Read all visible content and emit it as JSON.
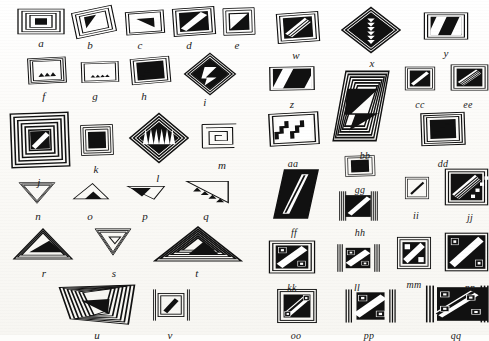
{
  "plate": {
    "kind": "figure-plate",
    "description": "Black-and-white geometric design motif typology plate",
    "background_color": "#fbfaf7",
    "ink_color": "#111111",
    "width": 489,
    "height": 335,
    "columns": 2
  },
  "figures": [
    {
      "label": "a",
      "shape": "rect",
      "motif": "concentric-rectangle-spiral",
      "x": 16,
      "y": 8,
      "w": 50,
      "h": 27,
      "rot": 0,
      "lx": 41,
      "ly": 38
    },
    {
      "label": "b",
      "shape": "rhomboid",
      "motif": "nested-frame-black-triangle",
      "x": 72,
      "y": 8,
      "w": 44,
      "h": 28,
      "rot": -12,
      "lx": 90,
      "ly": 40
    },
    {
      "label": "c",
      "shape": "rect",
      "motif": "single-frame-black-corner-triangle",
      "x": 124,
      "y": 10,
      "w": 42,
      "h": 25,
      "rot": -4,
      "lx": 140,
      "ly": 40
    },
    {
      "label": "d",
      "shape": "rect",
      "motif": "double-frame-black-diagonal-band",
      "x": 172,
      "y": 7,
      "w": 44,
      "h": 29,
      "rot": -4,
      "lx": 189,
      "ly": 40
    },
    {
      "label": "e",
      "shape": "rect",
      "motif": "frame-black-diagonal-half",
      "x": 222,
      "y": 7,
      "w": 34,
      "h": 29,
      "rot": -2,
      "lx": 237,
      "ly": 40
    },
    {
      "label": "f",
      "shape": "rect",
      "motif": "frame-three-black-triangles",
      "x": 27,
      "y": 57,
      "w": 40,
      "h": 27,
      "rot": -3,
      "lx": 44,
      "ly": 91
    },
    {
      "label": "g",
      "shape": "rect",
      "motif": "frame-four-black-triangles",
      "x": 80,
      "y": 61,
      "w": 40,
      "h": 22,
      "rot": -2,
      "lx": 95,
      "ly": 91
    },
    {
      "label": "h",
      "shape": "rect",
      "motif": "frame-black-stepped-diagonal",
      "x": 130,
      "y": 57,
      "w": 41,
      "h": 27,
      "rot": -5,
      "lx": 144,
      "ly": 91
    },
    {
      "label": "i",
      "shape": "diamond",
      "motif": "nested-diamond-black-zigzag",
      "x": 183,
      "y": 52,
      "w": 54,
      "h": 44,
      "rot": 0,
      "lx": 205,
      "ly": 97
    },
    {
      "label": "j",
      "shape": "rect",
      "motif": "many-concentric-square-spiral",
      "x": 10,
      "y": 112,
      "w": 60,
      "h": 56,
      "rot": -2,
      "lx": 39,
      "ly": 177
    },
    {
      "label": "k",
      "shape": "rect",
      "motif": "concentric-frame-black-diagonal",
      "x": 80,
      "y": 124,
      "w": 34,
      "h": 32,
      "rot": -2,
      "lx": 96,
      "ly": 164
    },
    {
      "label": "l",
      "shape": "diamond",
      "motif": "nested-diamond-black-sawtooth",
      "x": 128,
      "y": 112,
      "w": 62,
      "h": 52,
      "rot": 0,
      "lx": 158,
      "ly": 173
    },
    {
      "label": "m",
      "shape": "rect",
      "motif": "open-rectangle-fret-spiral",
      "x": 200,
      "y": 122,
      "w": 38,
      "h": 28,
      "rot": -1,
      "lx": 222,
      "ly": 160
    },
    {
      "label": "n",
      "shape": "triangle",
      "motif": "inverted-triangle-outline-nested",
      "x": 18,
      "y": 182,
      "w": 38,
      "h": 22,
      "rot": 0,
      "lx": 38,
      "ly": 211
    },
    {
      "label": "o",
      "shape": "triangle",
      "motif": "triangle-black-base-triangle",
      "x": 72,
      "y": 180,
      "w": 38,
      "h": 22,
      "rot": 0,
      "lx": 90,
      "ly": 211
    },
    {
      "label": "p",
      "shape": "triangle",
      "motif": "triangle-black-wedge",
      "x": 126,
      "y": 182,
      "w": 40,
      "h": 20,
      "rot": 0,
      "lx": 145,
      "ly": 211
    },
    {
      "label": "q",
      "shape": "triangle",
      "motif": "triangle-sawtooth-row",
      "x": 185,
      "y": 178,
      "w": 45,
      "h": 28,
      "rot": 0,
      "lx": 206,
      "ly": 211
    },
    {
      "label": "r",
      "shape": "triangle",
      "motif": "wide-triangle-nested-black-core",
      "x": 12,
      "y": 228,
      "w": 62,
      "h": 32,
      "rot": 0,
      "lx": 44,
      "ly": 268
    },
    {
      "label": "s",
      "shape": "triangle",
      "motif": "inverted-triangle-nested-spiral",
      "x": 94,
      "y": 228,
      "w": 38,
      "h": 28,
      "rot": 0,
      "lx": 114,
      "ly": 268
    },
    {
      "label": "t",
      "shape": "triangle",
      "motif": "wide-triangle-many-nested-bands",
      "x": 152,
      "y": 226,
      "w": 92,
      "h": 36,
      "rot": 0,
      "lx": 197,
      "ly": 268
    },
    {
      "label": "u",
      "shape": "trapezoid",
      "motif": "trapezoid-many-nested-bands",
      "x": 58,
      "y": 283,
      "w": 78,
      "h": 42,
      "rot": 0,
      "lx": 97,
      "ly": 330
    },
    {
      "label": "v",
      "shape": "rect",
      "motif": "rect-fret-with-vertical-bars",
      "x": 152,
      "y": 288,
      "w": 38,
      "h": 34,
      "rot": 0,
      "lx": 170,
      "ly": 330
    },
    {
      "label": "w",
      "shape": "rect",
      "motif": "frame-black-with-light-diagonal-band",
      "x": 276,
      "y": 12,
      "w": 44,
      "h": 31,
      "rot": -4,
      "lx": 296,
      "ly": 50
    },
    {
      "label": "x",
      "shape": "diamond",
      "motif": "large-diamond-black-zipper-core",
      "x": 340,
      "y": 6,
      "w": 62,
      "h": 48,
      "rot": 0,
      "lx": 372,
      "ly": 58
    },
    {
      "label": "y",
      "shape": "rect",
      "motif": "frame-three-diagonal-black-bars",
      "x": 423,
      "y": 12,
      "w": 46,
      "h": 28,
      "rot": 0,
      "lx": 446,
      "ly": 48
    },
    {
      "label": "z",
      "shape": "rect",
      "motif": "band-two-diagonal-black-stripes",
      "x": 268,
      "y": 66,
      "w": 48,
      "h": 25,
      "rot": -1,
      "lx": 292,
      "ly": 99
    },
    {
      "label": "bb",
      "shape": "rhomboid",
      "motif": "large-rhomboid-nested-black-zigzag",
      "x": 332,
      "y": 70,
      "w": 58,
      "h": 72,
      "rot": 0,
      "lx": 365,
      "ly": 150
    },
    {
      "label": "cc",
      "shape": "rect",
      "motif": "frame-black-half-light-diagonal",
      "x": 404,
      "y": 66,
      "w": 32,
      "h": 25,
      "rot": 0,
      "lx": 420,
      "ly": 99
    },
    {
      "label": "ee",
      "shape": "rect",
      "motif": "frame-striped-diagonal-band",
      "x": 450,
      "y": 64,
      "w": 39,
      "h": 27,
      "rot": 0,
      "lx": 468,
      "ly": 99
    },
    {
      "label": "aa",
      "shape": "rect",
      "motif": "frame-two-stepped-black-bands",
      "x": 268,
      "y": 112,
      "w": 52,
      "h": 34,
      "rot": -3,
      "lx": 293,
      "ly": 158
    },
    {
      "label": "dd",
      "shape": "rect",
      "motif": "frame-black-stepped-diagonal-wide",
      "x": 420,
      "y": 112,
      "w": 46,
      "h": 34,
      "rot": -2,
      "lx": 443,
      "ly": 158
    },
    {
      "label": "gg",
      "shape": "rect",
      "motif": "small-frame-black-step",
      "x": 344,
      "y": 155,
      "w": 32,
      "h": 22,
      "rot": -2,
      "lx": 360,
      "ly": 184
    },
    {
      "label": "ff",
      "shape": "rhomboid",
      "motif": "rhomboid-black-striped-diagonal",
      "x": 272,
      "y": 168,
      "w": 48,
      "h": 52,
      "rot": 0,
      "lx": 294,
      "ly": 227
    },
    {
      "label": "hh",
      "shape": "rect",
      "motif": "vertical-bars-with-diagonal-band",
      "x": 338,
      "y": 190,
      "w": 40,
      "h": 32,
      "rot": 0,
      "lx": 360,
      "ly": 227
    },
    {
      "label": "ii",
      "shape": "rect",
      "motif": "small-frame-thin-diagonal",
      "x": 404,
      "y": 176,
      "w": 26,
      "h": 24,
      "rot": 0,
      "lx": 416,
      "ly": 210
    },
    {
      "label": "jj",
      "shape": "rect",
      "motif": "frame-black-striped-diagonal-cropped",
      "x": 444,
      "y": 168,
      "w": 45,
      "h": 38,
      "rot": 0,
      "lx": 470,
      "ly": 212
    },
    {
      "label": "kk",
      "shape": "rect",
      "motif": "frame-diagonal-with-corner-frets",
      "x": 268,
      "y": 240,
      "w": 48,
      "h": 34,
      "rot": 0,
      "lx": 292,
      "ly": 282
    },
    {
      "label": "ll",
      "shape": "rect",
      "motif": "barred-frame-diagonal-corner-frets",
      "x": 336,
      "y": 243,
      "w": 44,
      "h": 30,
      "rot": 0,
      "lx": 357,
      "ly": 282
    },
    {
      "label": "mm",
      "shape": "rect",
      "motif": "frame-diagonal-two-white-squares",
      "x": 396,
      "y": 236,
      "w": 36,
      "h": 34,
      "rot": 0,
      "lx": 414,
      "ly": 279
    },
    {
      "label": "nn",
      "shape": "rect",
      "motif": "frame-diagonal-corner-frets-cropped",
      "x": 444,
      "y": 232,
      "w": 45,
      "h": 40,
      "rot": 0,
      "lx": 470,
      "ly": 282
    },
    {
      "label": "oo",
      "shape": "rect",
      "motif": "frame-double-diagonal-corner-frets",
      "x": 276,
      "y": 288,
      "w": 42,
      "h": 36,
      "rot": 0,
      "lx": 296,
      "ly": 330
    },
    {
      "label": "pp",
      "shape": "rect",
      "motif": "barred-frame-wide-diagonal-frets",
      "x": 344,
      "y": 288,
      "w": 52,
      "h": 36,
      "rot": 0,
      "lx": 369,
      "ly": 330
    },
    {
      "label": "qq",
      "shape": "rect",
      "motif": "complex-fret-diagonal-panel-cropped",
      "x": 424,
      "y": 284,
      "w": 65,
      "h": 40,
      "rot": 0,
      "lx": 456,
      "ly": 330
    }
  ]
}
